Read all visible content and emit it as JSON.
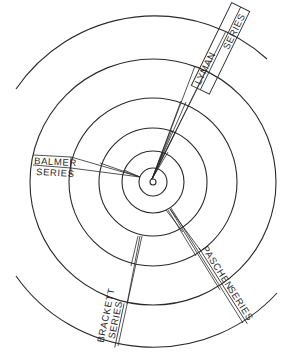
{
  "diagram": {
    "center": [
      153,
      182
    ],
    "ring_radii": [
      3,
      14,
      31,
      54,
      84,
      123
    ],
    "outer_arc_radius": 168,
    "stroke_color": "#2a2a2a",
    "background": "#ffffff",
    "series": [
      {
        "name": "lyman",
        "line1": "LYMAN",
        "line2": "SERIES"
      },
      {
        "name": "balmer",
        "line1": "BALMER",
        "line2": "SERIES"
      },
      {
        "name": "paschen",
        "line1": "PASCHEN",
        "line2": "SERIES"
      },
      {
        "name": "brackett",
        "line1": "BRACKETT",
        "line2": "SERIES"
      }
    ]
  }
}
